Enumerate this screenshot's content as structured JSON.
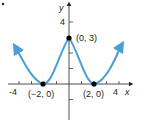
{
  "figure": {
    "bullet": "•",
    "axes": {
      "x_label": "x",
      "y_label": "y",
      "x_ticks": [
        "-4",
        "4"
      ],
      "y_ticks": [
        "4"
      ]
    },
    "points": [
      {
        "label": "(0, 3)",
        "x": 0,
        "y": 3
      },
      {
        "label": "(−2, 0)",
        "x": -2,
        "y": 0
      },
      {
        "label": "(2, 0)",
        "x": 2,
        "y": 0
      }
    ],
    "colors": {
      "curve": "#4a9fd4",
      "axis": "#231f20",
      "point": "#000000"
    }
  }
}
